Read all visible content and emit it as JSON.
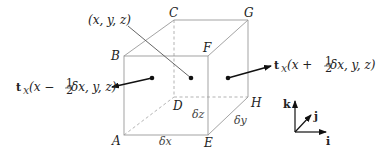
{
  "diagram": {
    "vertices": {
      "A": {
        "label": "A"
      },
      "B": {
        "label": "B"
      },
      "C": {
        "label": "C"
      },
      "D": {
        "label": "D"
      },
      "E": {
        "label": "E"
      },
      "F": {
        "label": "F"
      },
      "G": {
        "label": "G"
      },
      "H": {
        "label": "H"
      }
    },
    "center_point_label": "(x, y, z)",
    "dimensions": {
      "dx": "δx",
      "dy": "δy",
      "dz": "δz"
    },
    "traction_left": {
      "bold": "t",
      "sub": "x",
      "pre": "(x − ",
      "frac_num": "1",
      "frac_den": "2",
      "post": " δx, y, z)"
    },
    "traction_right": {
      "bold": "t",
      "sub": "x",
      "pre": "(x + ",
      "frac_num": "1",
      "frac_den": "2",
      "post": " δx, y, z)"
    },
    "axes": {
      "i": "i",
      "j": "j",
      "k": "k"
    }
  }
}
